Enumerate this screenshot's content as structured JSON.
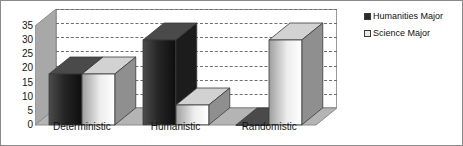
{
  "chart_data": {
    "type": "bar",
    "title": "",
    "subtitle": "",
    "xlabel": "",
    "ylabel": "",
    "categories": [
      "Deterministic",
      "Humanistic",
      "Randomistic"
    ],
    "series": [
      {
        "name": "Humanities Major",
        "values": [
          18,
          30,
          0
        ],
        "color": "#2b2b2b"
      },
      {
        "name": "Science Major",
        "values": [
          18,
          7,
          30
        ],
        "color": "#e8e8e8"
      }
    ],
    "ylim": [
      0,
      35
    ],
    "ytick_labels": [
      "0",
      "5",
      "10",
      "15",
      "20",
      "25",
      "30",
      "35"
    ],
    "ytick_values": [
      0,
      5,
      10,
      15,
      20,
      25,
      30,
      35
    ],
    "grid": true,
    "grid_style": "dashed-horizontal",
    "legend_position": "right",
    "three_d": true,
    "background_color": "#ffffff",
    "grid_color": "#6f6f6f",
    "axis_color": "#9a9a9a",
    "border_color": "#8a8a8a"
  },
  "legend": {
    "entries": [
      {
        "label": "Humanities Major",
        "swatch": "dark"
      },
      {
        "label": "Science Major",
        "swatch": "light"
      }
    ]
  }
}
